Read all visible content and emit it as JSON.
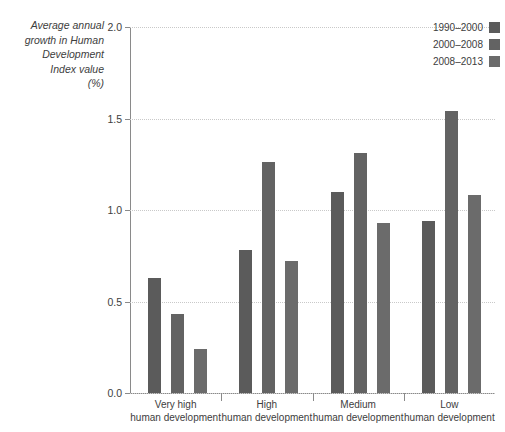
{
  "chart_data": {
    "type": "bar",
    "title": "",
    "subtitle": "",
    "xlabel": "",
    "ylabel": "Average annual\ngrowth in Human\nDevelopment\nIndex value\n(%)",
    "ylim": [
      0.0,
      2.0
    ],
    "ytick_labels": [
      "0.0",
      "0.5",
      "1.0",
      "1.5",
      "2.0"
    ],
    "ytick_values": [
      0.0,
      0.5,
      1.0,
      1.5,
      2.0
    ],
    "grid": "horizontal-dotted",
    "legend_position": "top-right",
    "categories": [
      "Very high\nhuman development",
      "High\nhuman development",
      "Medium\nhuman development",
      "Low\nhuman development"
    ],
    "series": [
      {
        "name": "1990–2000",
        "color": "#5b5b5b",
        "values": [
          0.63,
          0.78,
          1.1,
          0.94
        ]
      },
      {
        "name": "2000–2008",
        "color": "#636363",
        "values": [
          0.43,
          1.26,
          1.31,
          1.54
        ]
      },
      {
        "name": "2008–2013",
        "color": "#6b6b6b",
        "values": [
          0.24,
          0.72,
          0.93,
          1.08
        ]
      }
    ]
  },
  "legend": {
    "items": [
      {
        "label": "1990–2000",
        "color": "#5b5b5b"
      },
      {
        "label": "2000–2008",
        "color": "#636363"
      },
      {
        "label": "2008–2013",
        "color": "#6b6b6b"
      }
    ]
  },
  "axis": {
    "y_title": "Average annual\ngrowth in Human\nDevelopment\nIndex value\n(%)",
    "y_ticks": [
      "2.0",
      "1.5",
      "1.0",
      "0.5",
      "0.0"
    ]
  }
}
